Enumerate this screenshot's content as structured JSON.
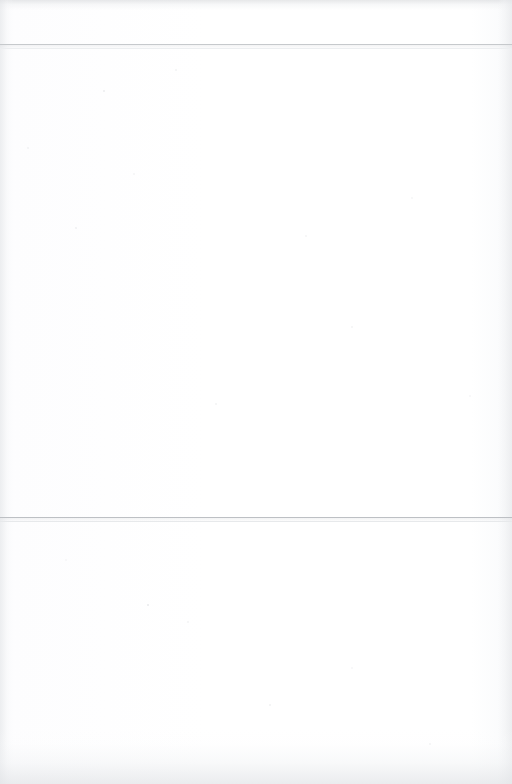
{
  "document": {
    "page_kind": "blank-scanned-page",
    "page_width": 512,
    "page_height": 784,
    "header_text": "",
    "body_text": "",
    "footer_text": "",
    "page_number": "",
    "running_head": ""
  },
  "colors": {
    "paper": "#fefefe",
    "rule_primary": "#c6c9cc",
    "rule_secondary": "#eceef0",
    "rule_primary_lower": "#bdc0c4",
    "rule_secondary_lower": "#e7e9eb",
    "scan_edge_gray": "#e2e4e7"
  },
  "rules": [
    {
      "name": "top-rule",
      "y_main": 44,
      "y_echo": 48,
      "x_start": 0,
      "x_end": 512,
      "thickness": 1,
      "color_main": "#c6c9cc",
      "color_echo": "#eceef0"
    },
    {
      "name": "mid-rule",
      "y_main": 517,
      "y_echo": 521,
      "x_start": 0,
      "x_end": 512,
      "thickness": 1,
      "color_main": "#bdc0c4",
      "color_echo": "#e7e9eb"
    }
  ],
  "regions": [
    {
      "name": "header-band",
      "label": "",
      "top": 0,
      "height": 44
    },
    {
      "name": "upper-text-block",
      "label": "",
      "top": 49,
      "height": 468
    },
    {
      "name": "lower-text-block",
      "label": "",
      "top": 522,
      "height": 262
    }
  ]
}
